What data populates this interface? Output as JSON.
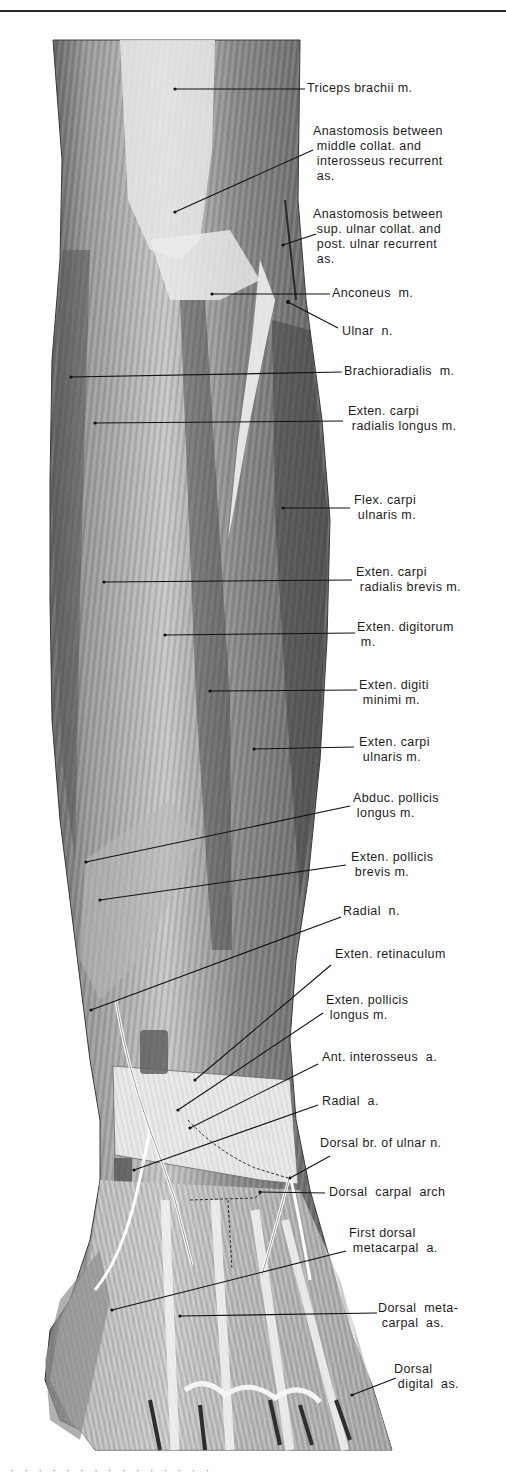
{
  "page": {
    "figure_type": "anatomical illustration — posterior forearm and dorsum of hand",
    "colors": {
      "background": "#ffffff",
      "ink": "#1c1c1c",
      "muscle_dark": "#4a4a4a",
      "muscle_mid": "#8c8c8c",
      "tendon_light": "#e4e4e4"
    }
  },
  "labels": [
    {
      "id": "triceps",
      "text": "Triceps brachii m.",
      "x": 307,
      "y": 81
    },
    {
      "id": "anast-middle",
      "text": "Anastomosis between\n middle collat. and\n interosseus recurrent\n as.",
      "x": 313,
      "y": 124
    },
    {
      "id": "anast-sup",
      "text": "Anastomosis between\n sup. ulnar collat. and\n post. ulnar recurrent\n as.",
      "x": 313,
      "y": 207
    },
    {
      "id": "anconeus",
      "text": "Anconeus  m.",
      "x": 332,
      "y": 286
    },
    {
      "id": "ulnar-n",
      "text": "Ulnar  n.",
      "x": 342,
      "y": 324
    },
    {
      "id": "brachioradialis",
      "text": "Brachioradialis  m.",
      "x": 344,
      "y": 364
    },
    {
      "id": "ecrl",
      "text": "Exten. carpi\n radialis longus m.",
      "x": 348,
      "y": 404
    },
    {
      "id": "fcu",
      "text": "Flex. carpi\n ulnaris m.",
      "x": 354,
      "y": 493
    },
    {
      "id": "ecrb",
      "text": "Exten. carpi\n radialis brevis m.",
      "x": 356,
      "y": 565
    },
    {
      "id": "ext-digitorum",
      "text": "Exten. digitorum\n m.",
      "x": 357,
      "y": 620
    },
    {
      "id": "ext-digiti-minimi",
      "text": "Exten. digiti\n minimi m.",
      "x": 359,
      "y": 678
    },
    {
      "id": "ecu",
      "text": "Exten. carpi\n ulnaris m.",
      "x": 359,
      "y": 735
    },
    {
      "id": "apl",
      "text": "Abduc. pollicis\n longus m.",
      "x": 353,
      "y": 791
    },
    {
      "id": "epb",
      "text": "Exten. pollicis\n brevis m.",
      "x": 351,
      "y": 850
    },
    {
      "id": "radial-n",
      "text": "Radial  n.",
      "x": 343,
      "y": 904
    },
    {
      "id": "ext-retinaculum",
      "text": "Exten. retinaculum",
      "x": 335,
      "y": 947
    },
    {
      "id": "epl",
      "text": "Exten. pollicis\n longus m.",
      "x": 326,
      "y": 993
    },
    {
      "id": "ant-interosseus",
      "text": "Ant. interosseus  a.",
      "x": 322,
      "y": 1050
    },
    {
      "id": "radial-a",
      "text": "Radial  a.",
      "x": 322,
      "y": 1094
    },
    {
      "id": "dorsal-br-ulnar",
      "text": "Dorsal br. of ulnar n.",
      "x": 320,
      "y": 1136
    },
    {
      "id": "dorsal-carpal-arch",
      "text": "Dorsal  carpal  arch",
      "x": 329,
      "y": 1185
    },
    {
      "id": "first-dorsal-metacarpal",
      "text": "First dorsal\n metacarpal  a.",
      "x": 349,
      "y": 1226
    },
    {
      "id": "dorsal-metacarpal",
      "text": "Dorsal  meta-\n carpal  as.",
      "x": 378,
      "y": 1301
    },
    {
      "id": "dorsal-digital",
      "text": "Dorsal\n digital  as.",
      "x": 394,
      "y": 1362
    }
  ],
  "leaders": [
    {
      "for": "triceps",
      "x1": 175,
      "y1": 89,
      "x2": 305,
      "y2": 89
    },
    {
      "for": "anast-middle",
      "x1": 175,
      "y1": 212,
      "x2": 313,
      "y2": 150
    },
    {
      "for": "anast-sup",
      "x1": 283,
      "y1": 245,
      "x2": 316,
      "y2": 234
    },
    {
      "for": "anconeus",
      "x1": 212,
      "y1": 294,
      "x2": 330,
      "y2": 294
    },
    {
      "for": "ulnar-n",
      "x1": 288,
      "y1": 302,
      "x2": 338,
      "y2": 328
    },
    {
      "for": "brachioradialis",
      "x1": 71,
      "y1": 377,
      "x2": 342,
      "y2": 372
    },
    {
      "for": "ecrl",
      "x1": 95,
      "y1": 423,
      "x2": 343,
      "y2": 421
    },
    {
      "for": "fcu",
      "x1": 283,
      "y1": 508,
      "x2": 350,
      "y2": 508
    },
    {
      "for": "ecrb",
      "x1": 104,
      "y1": 582,
      "x2": 352,
      "y2": 580
    },
    {
      "for": "ext-digitorum",
      "x1": 165,
      "y1": 635,
      "x2": 355,
      "y2": 633
    },
    {
      "for": "ext-digiti-minimi",
      "x1": 210,
      "y1": 691,
      "x2": 357,
      "y2": 690
    },
    {
      "for": "ecu",
      "x1": 254,
      "y1": 749,
      "x2": 354,
      "y2": 747
    },
    {
      "for": "apl",
      "x1": 86,
      "y1": 862,
      "x2": 350,
      "y2": 806
    },
    {
      "for": "epb",
      "x1": 100,
      "y1": 900,
      "x2": 346,
      "y2": 865
    },
    {
      "for": "radial-n",
      "x1": 91,
      "y1": 1010,
      "x2": 341,
      "y2": 917
    },
    {
      "for": "ext-retinaculum",
      "x1": 195,
      "y1": 1080,
      "x2": 331,
      "y2": 965
    },
    {
      "for": "epl",
      "x1": 178,
      "y1": 1110,
      "x2": 323,
      "y2": 1013
    },
    {
      "for": "ant-interosseus",
      "x1": 190,
      "y1": 1128,
      "x2": 318,
      "y2": 1064
    },
    {
      "for": "radial-a",
      "x1": 134,
      "y1": 1170,
      "x2": 318,
      "y2": 1105
    },
    {
      "for": "dorsal-br-ulnar",
      "x1": 290,
      "y1": 1178,
      "x2": 330,
      "y2": 1156
    },
    {
      "for": "dorsal-carpal-arch",
      "x1": 260,
      "y1": 1192,
      "x2": 325,
      "y2": 1193
    },
    {
      "for": "first-dorsal-metacarpal",
      "x1": 112,
      "y1": 1310,
      "x2": 346,
      "y2": 1251
    },
    {
      "for": "dorsal-metacarpal",
      "x1": 180,
      "y1": 1316,
      "x2": 377,
      "y2": 1313
    },
    {
      "for": "dorsal-digital",
      "x1": 352,
      "y1": 1395,
      "x2": 396,
      "y2": 1378
    }
  ]
}
